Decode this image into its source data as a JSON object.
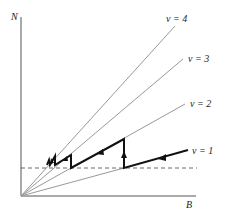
{
  "diagram": {
    "axes": {
      "y_label": "N",
      "x_label": "B"
    },
    "rays": [
      {
        "label": "ν = 4",
        "nu": 4
      },
      {
        "label": "ν = 3",
        "nu": 3
      },
      {
        "label": "ν = 2",
        "nu": 2
      },
      {
        "label": "ν = 1",
        "nu": 1
      }
    ],
    "threshold_line": "dashed horizontal",
    "path": "staircase trajectory with arrows moving from ν = 1 toward higher ν"
  }
}
